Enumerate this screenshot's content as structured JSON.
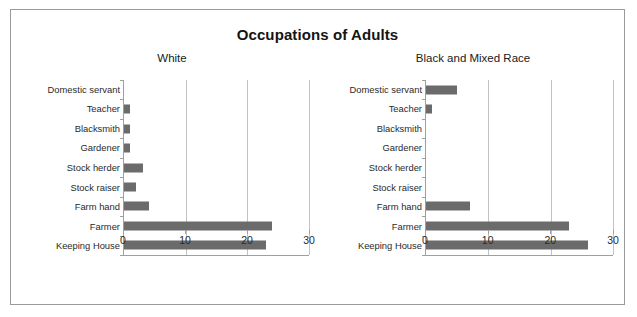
{
  "chart_data": {
    "type": "bar",
    "orientation": "horizontal",
    "title": "Occupations of Adults",
    "xlabel": "",
    "ylabel": "",
    "xlim": [
      0,
      30
    ],
    "xticks": [
      0,
      10,
      20,
      30
    ],
    "xtick_labels": [
      "0",
      "10",
      "20",
      "30"
    ],
    "grid": true,
    "legend": "none",
    "bar_color": "#6b6b6b",
    "categories": [
      "Domestic servant",
      "Teacher",
      "Blacksmith",
      "Gardener",
      "Stock herder",
      "Stock raiser",
      "Farm hand",
      "Farmer",
      "Keeping House"
    ],
    "panels": [
      {
        "subtitle": "White",
        "values": [
          0,
          1,
          1,
          1,
          3,
          2,
          4,
          24,
          23
        ]
      },
      {
        "subtitle": "Black and Mixed Race",
        "values": [
          5,
          1,
          0,
          0,
          0,
          0,
          7,
          23,
          26
        ]
      }
    ]
  }
}
